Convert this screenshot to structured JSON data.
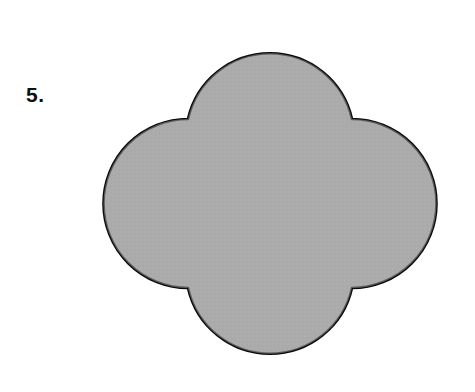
{
  "page": {
    "background_color": "#ffffff",
    "width": 475,
    "height": 392
  },
  "problem": {
    "number_label": "5."
  },
  "figure": {
    "name": "quatrefoil",
    "fill_color": "#ababab",
    "outline_color": "#0a0a0a",
    "outline_width": 2.6,
    "center": {
      "x": 270,
      "y": 197
    },
    "lobe_radius": 84,
    "bounds": {
      "left": 104,
      "top": 34,
      "right": 437,
      "bottom": 361
    },
    "cusps": [
      {
        "x": 188,
        "y": 119
      },
      {
        "x": 352,
        "y": 119
      },
      {
        "x": 352,
        "y": 288
      },
      {
        "x": 188,
        "y": 288
      }
    ],
    "path": "M 188 119 A 84 84 0 0 1 352 119 A 84 84 0 0 1 352 288 A 84 84 0 0 1 188 288 A 84 84 0 0 1 188 119 Z"
  }
}
